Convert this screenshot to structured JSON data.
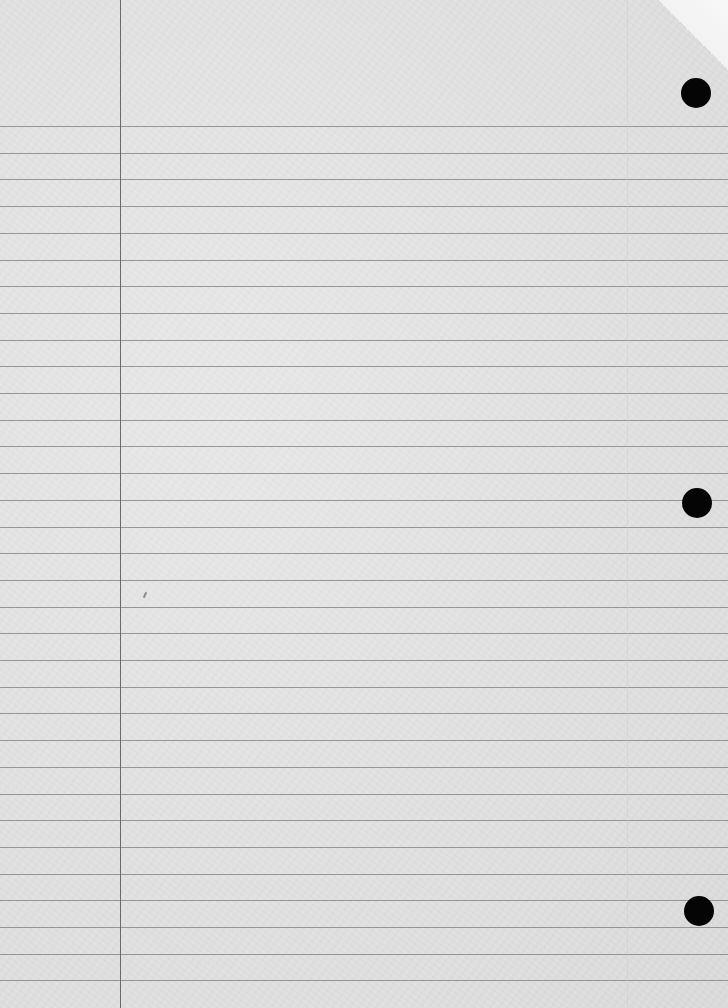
{
  "image": {
    "description": "Blank sheet of lined notebook paper with three punched holes on the right edge",
    "paper_color": "#e3e3e3",
    "rule_color": "#7d7d7d",
    "margin_line_color": "#6a6a6a",
    "hole_color": "#050505",
    "rules": {
      "count": 33,
      "first_y": 126,
      "spacing": 26.7
    },
    "left_margin_x": 120,
    "holes": [
      {
        "name": "top",
        "cx": 696,
        "cy": 93
      },
      {
        "name": "middle",
        "cx": 697,
        "cy": 503
      },
      {
        "name": "bottom",
        "cx": 699,
        "cy": 911
      }
    ],
    "text": []
  }
}
